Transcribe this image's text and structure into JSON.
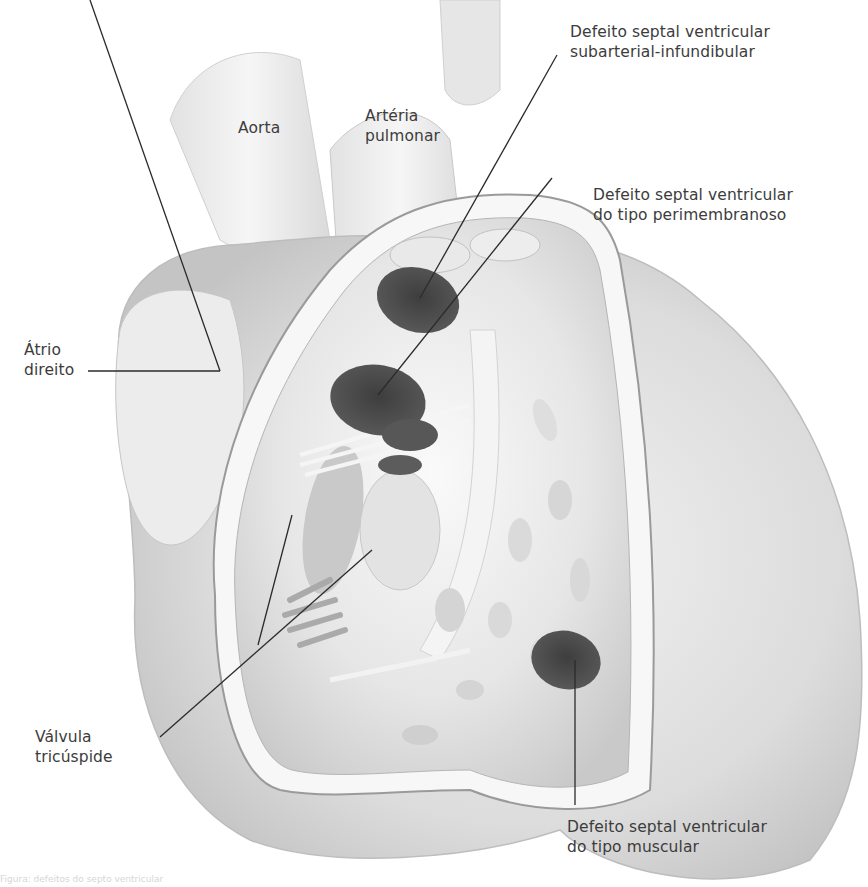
{
  "figure": {
    "colors": {
      "background": "#ffffff",
      "tissue_light": "#efefef",
      "tissue_mid": "#cfcfcf",
      "tissue_dark": "#a9a9a9",
      "defect_fill": "#4a4a4a",
      "leader_line": "#2b2b2b",
      "label_text": "#3c3c3c"
    }
  },
  "labels": {
    "aorta": {
      "line1": "Aorta"
    },
    "arteria_pulmonar": {
      "line1": "Artéria",
      "line2": "pulmonar"
    },
    "dsv_subarterial": {
      "line1": "Defeito septal ventricular",
      "line2": "subarterial-infundibular"
    },
    "dsv_perimembranoso": {
      "line1": "Defeito septal ventricular",
      "line2": "do tipo perimembranoso"
    },
    "atrio_direito": {
      "line1": "Átrio",
      "line2": "direito"
    },
    "valvula_tricuspide": {
      "line1": "Válvula",
      "line2": "tricúspide"
    },
    "dsv_muscular": {
      "line1": "Defeito septal ventricular",
      "line2": "do tipo muscular"
    }
  },
  "caption": {
    "text": "Figura: defeitos do septo ventricular"
  }
}
